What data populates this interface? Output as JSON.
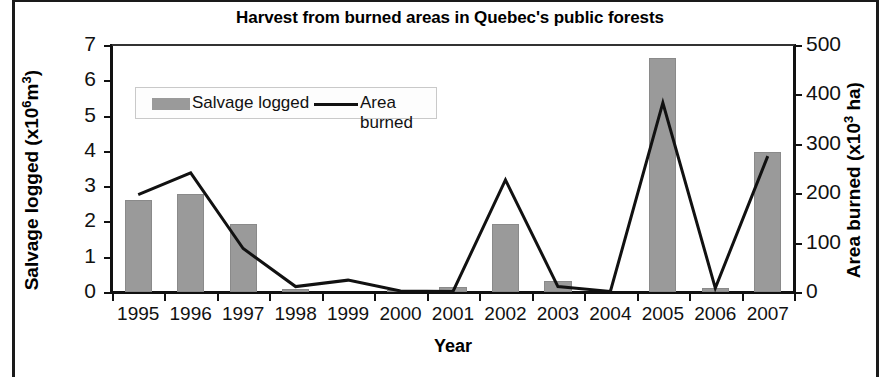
{
  "chart_data": {
    "type": "bar",
    "title": "Harvest from burned areas in Quebec's public forests",
    "xlabel": "Year",
    "categories": [
      "1995",
      "1996",
      "1997",
      "1998",
      "1999",
      "2000",
      "2001",
      "2002",
      "2003",
      "2004",
      "2005",
      "2006",
      "2007"
    ],
    "grid": false,
    "legend_position": "upper-left-inside",
    "series": [
      {
        "name": "Salvage logged",
        "render": "bar",
        "axis": "left",
        "unit": "x10^6 m3",
        "color": "#9a9a9a",
        "values": [
          2.62,
          2.79,
          1.92,
          0.08,
          0.0,
          0.05,
          0.15,
          1.92,
          0.32,
          0.0,
          6.63,
          0.12,
          3.97
        ]
      },
      {
        "name": "Area burned",
        "render": "line",
        "axis": "right",
        "unit": "x10^3 ha",
        "color": "#111111",
        "values": [
          197,
          241,
          88,
          11,
          24,
          2,
          1,
          227,
          11,
          1,
          383,
          8,
          275
        ]
      }
    ],
    "axes": {
      "left": {
        "label_text": "Salvage logged (x10",
        "label_sup": "6",
        "label_tail": "m",
        "label_sup2": "3",
        "label_close": ")",
        "label_full": "Salvage logged (x10⁶m³)",
        "ticks": [
          "0",
          "1",
          "2",
          "3",
          "4",
          "5",
          "6",
          "7"
        ],
        "min": 0,
        "max": 7
      },
      "right": {
        "label_text": "Area burned (x10",
        "label_sup": "3",
        "label_close": " ha)",
        "label_full": "Area burned (x10³ ha)",
        "ticks": [
          "0",
          "100",
          "200",
          "300",
          "400",
          "500"
        ],
        "min": 0,
        "max": 500
      }
    }
  },
  "legend": {
    "bar_label": "Salvage logged",
    "line_label": "Area burned"
  }
}
